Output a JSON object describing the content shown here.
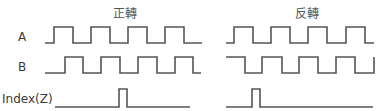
{
  "diagram": {
    "titles": {
      "forward": "正轉",
      "reverse": "反轉"
    },
    "signal_labels": {
      "a": "A",
      "b": "B",
      "z": "Index(Z)"
    },
    "colors": {
      "line": "#555555",
      "text": "#3a3a3a"
    },
    "waveforms": {
      "forward": {
        "a": "M45,43 L54,43 L54,27 L73,27 L73,43 L91,43 L91,27 L110,27 L110,43 L128,43 L128,27 L147,27 L147,43 L165,43 L165,27 L184,27 L184,43 L202,43",
        "b": "M45,73 L65,73 L65,57 L83,57 L83,73 L101,73 L101,57 L120,57 L120,73 L138,73 L138,57 L157,57 L157,73 L175,73 L175,57 L193,57 L193,73 L201,73",
        "z": "M55,107 L119,107 L119,89 L127,89 L127,107 L190,107"
      },
      "reverse": {
        "a": "M226,43 L234,43 L234,27 L253,27 L253,43 L271,43 L271,27 L290,27 L290,43 L308,43 L308,27 L327,27 L327,43 L346,43 L346,27 L365,27 L365,43 L374,43",
        "b": "M226,57 L245,57 L245,73 L262,73 L262,57 L282,57 L282,73 L299,73 L299,57 L318,57 L318,73 L336,73 L336,57 L355,57 L355,73 L374,73 L374,57",
        "z": "M226,107 L252,107 L252,89 L260,89 L260,107 L373,107"
      }
    }
  }
}
